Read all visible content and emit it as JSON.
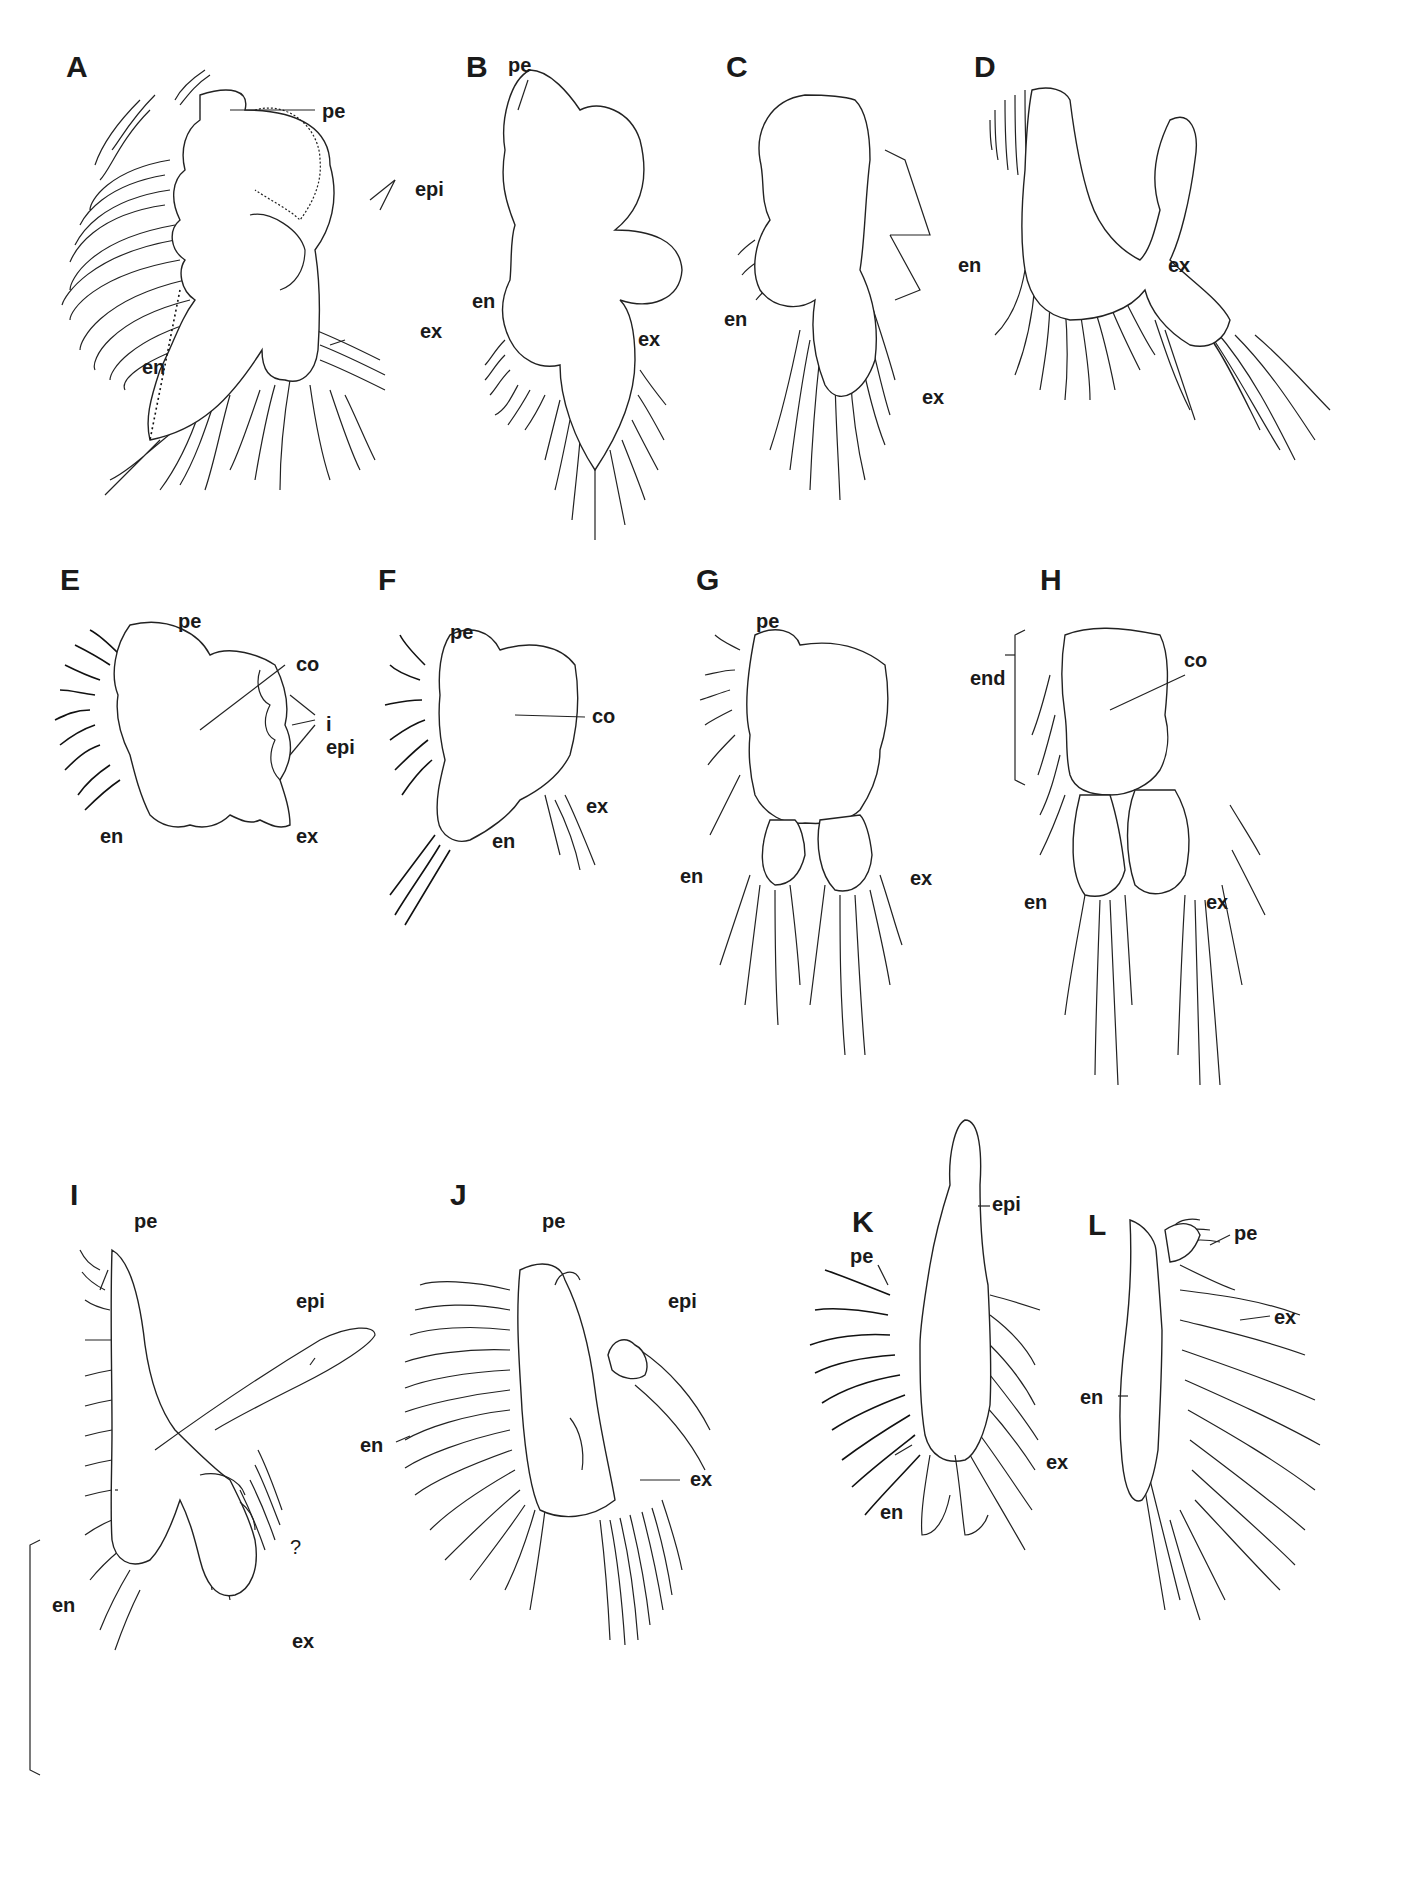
{
  "figure": {
    "panels": [
      {
        "id": "A",
        "labels": [
          "pe",
          "epi",
          "en",
          "ex"
        ]
      },
      {
        "id": "B",
        "labels": [
          "pe",
          "en",
          "ex"
        ]
      },
      {
        "id": "C",
        "labels": [
          "en",
          "ex"
        ]
      },
      {
        "id": "D",
        "labels": [
          "en",
          "ex"
        ]
      },
      {
        "id": "E",
        "labels": [
          "pe",
          "co",
          "i epi",
          "en",
          "ex"
        ]
      },
      {
        "id": "F",
        "labels": [
          "pe",
          "co",
          "ex",
          "en"
        ]
      },
      {
        "id": "G",
        "labels": [
          "pe",
          "en",
          "ex"
        ]
      },
      {
        "id": "H",
        "labels": [
          "end",
          "co",
          "en",
          "ex"
        ]
      },
      {
        "id": "I",
        "labels": [
          "pe",
          "epi",
          "?",
          "en",
          "ex"
        ]
      },
      {
        "id": "J",
        "labels": [
          "pe",
          "epi",
          "en",
          "ex"
        ]
      },
      {
        "id": "K",
        "labels": [
          "pe",
          "epi",
          "ex",
          "en"
        ]
      },
      {
        "id": "L",
        "labels": [
          "pe",
          "ex",
          "en"
        ]
      }
    ]
  },
  "text": {
    "A": "A",
    "B": "B",
    "C": "C",
    "D": "D",
    "E": "E",
    "F": "F",
    "G": "G",
    "H": "H",
    "I": "I",
    "J": "J",
    "K": "K",
    "L": "L",
    "pe": "pe",
    "epi": "epi",
    "en": "en",
    "ex": "ex",
    "co": "co",
    "i_epi": "i epi",
    "end": "end",
    "q": "?"
  }
}
